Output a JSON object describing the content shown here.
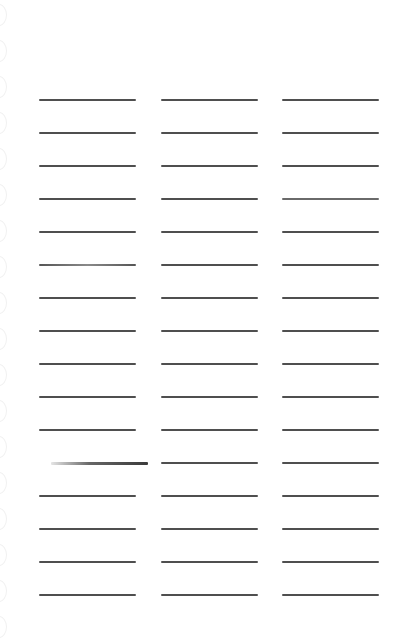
{
  "worksheet": {
    "background_color": "#ffffff",
    "line_color": "#4f4f4f",
    "columns": [
      {
        "id": "col-1",
        "left": 39,
        "rows": 16
      },
      {
        "id": "col-2",
        "left": 161,
        "rows": 16
      },
      {
        "id": "col-3",
        "left": 282,
        "rows": 16
      }
    ],
    "first_row_y": 99,
    "row_spacing": 33,
    "line_width": 97,
    "binder_rings": 18
  }
}
